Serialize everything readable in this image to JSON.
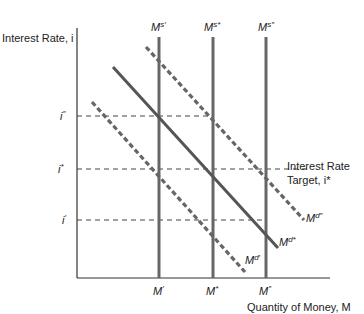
{
  "axes": {
    "y_label": "Interest Rate, i",
    "x_label": "Quantity of Money, M"
  },
  "supply_labels": [
    {
      "base": "M",
      "sup": "s′"
    },
    {
      "base": "M",
      "sup": "s*"
    },
    {
      "base": "M",
      "sup": "s″"
    }
  ],
  "x_ticks": [
    {
      "base": "M",
      "sup": "′"
    },
    {
      "base": "M",
      "sup": "*"
    },
    {
      "base": "M",
      "sup": "″"
    }
  ],
  "y_ticks": [
    {
      "base": "i",
      "sup": "″"
    },
    {
      "base": "i",
      "sup": "*"
    },
    {
      "base": "i",
      "sup": "′"
    }
  ],
  "demand_labels": [
    {
      "base": "M",
      "sup": "d″"
    },
    {
      "base": "M",
      "sup": "d*"
    },
    {
      "base": "M",
      "sup": "d′"
    }
  ],
  "annotation": {
    "line1": "Interest Rate",
    "line2": "Target, i*"
  },
  "colors": {
    "axis": "#333333",
    "curve": "#555555",
    "guide": "#444444"
  }
}
